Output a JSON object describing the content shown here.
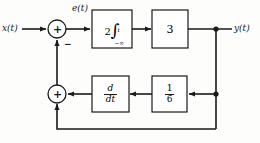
{
  "diagram": {
    "type": "control-system-block-diagram",
    "signals": {
      "input_label": "x(t)",
      "error_label": "e(t)",
      "output_label": "y(t)"
    },
    "summing_junctions": [
      {
        "id": "top-summer",
        "symbol": "+",
        "secondary_sign": "−",
        "x": 57,
        "y": 29
      },
      {
        "id": "bottom-summer",
        "symbol": "+",
        "x": 57,
        "y": 94
      }
    ],
    "blocks": [
      {
        "id": "integrator",
        "coefficient": "2",
        "operator": "∫",
        "upper_limit": "t",
        "lower_limit": "−∞",
        "text": "2∫ from −∞ to t"
      },
      {
        "id": "gain-3",
        "text": "3"
      },
      {
        "id": "derivative",
        "numerator": "d",
        "denominator": "dt",
        "text": "d/dt"
      },
      {
        "id": "gain-one-sixth",
        "numerator": "1",
        "denominator": "6",
        "text": "1/6"
      }
    ],
    "colors": {
      "line": "#1a1a1a",
      "background": "#fdfdfb",
      "block_fill": "#ffffff"
    }
  }
}
